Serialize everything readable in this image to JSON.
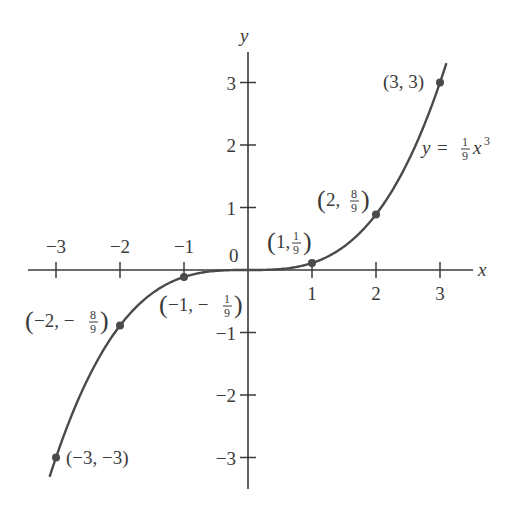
{
  "chart_data": {
    "type": "line",
    "title": "",
    "function_label": "y = (1/9) x^3",
    "function_label_parts": {
      "lhs": "y",
      "eq": "=",
      "num": "1",
      "den": "9",
      "var": "x",
      "exp": "3"
    },
    "xlabel": "x",
    "ylabel": "y",
    "xlim": [
      -3.3,
      3.5
    ],
    "ylim": [
      -3.5,
      3.5
    ],
    "origin_label": "0",
    "x_ticks": [
      -3,
      -2,
      -1,
      1,
      2,
      3
    ],
    "x_tick_labels": [
      "−3",
      "−2",
      "−1",
      "1",
      "2",
      "3"
    ],
    "y_ticks": [
      3,
      2,
      1,
      -1,
      -2,
      -3
    ],
    "y_tick_labels": [
      "3",
      "2",
      "1",
      "−1",
      "−2",
      "−3"
    ],
    "grid": false,
    "legend": null,
    "series": [
      {
        "name": "y = (1/9)x^3",
        "x": [
          -3.1,
          -3,
          -2.5,
          -2,
          -1.5,
          -1,
          -0.5,
          0,
          0.5,
          1,
          1.5,
          2,
          2.5,
          3,
          3.1
        ],
        "y": [
          -3.31,
          -3,
          -1.736,
          -0.889,
          -0.375,
          -0.111,
          -0.014,
          0,
          0.014,
          0.111,
          0.375,
          0.889,
          1.736,
          3,
          3.31
        ],
        "color": "#4a4a4a"
      }
    ],
    "marked_points": [
      {
        "x": 3,
        "y": 3,
        "label": "(3, 3)"
      },
      {
        "x": 2,
        "y": 0.889,
        "label": "(2, 8/9)",
        "whole": "2,",
        "num": "8",
        "den": "9"
      },
      {
        "x": 1,
        "y": 0.111,
        "label": "(1, 1/9)",
        "whole": "1,",
        "num": "1",
        "den": "9"
      },
      {
        "x": -1,
        "y": -0.111,
        "label": "(−1, −1/9)",
        "whole": "−1, −",
        "num": "1",
        "den": "9"
      },
      {
        "x": -2,
        "y": -0.889,
        "label": "(−2, −8/9)",
        "whole": "−2, −",
        "num": "8",
        "den": "9"
      },
      {
        "x": -3,
        "y": -3,
        "label": "(−3, −3)"
      }
    ],
    "colors": {
      "curve": "#4a4a4a",
      "axes": "#3a3a3a",
      "points": "#4a4a4a",
      "text": "#3a3a3a"
    }
  }
}
